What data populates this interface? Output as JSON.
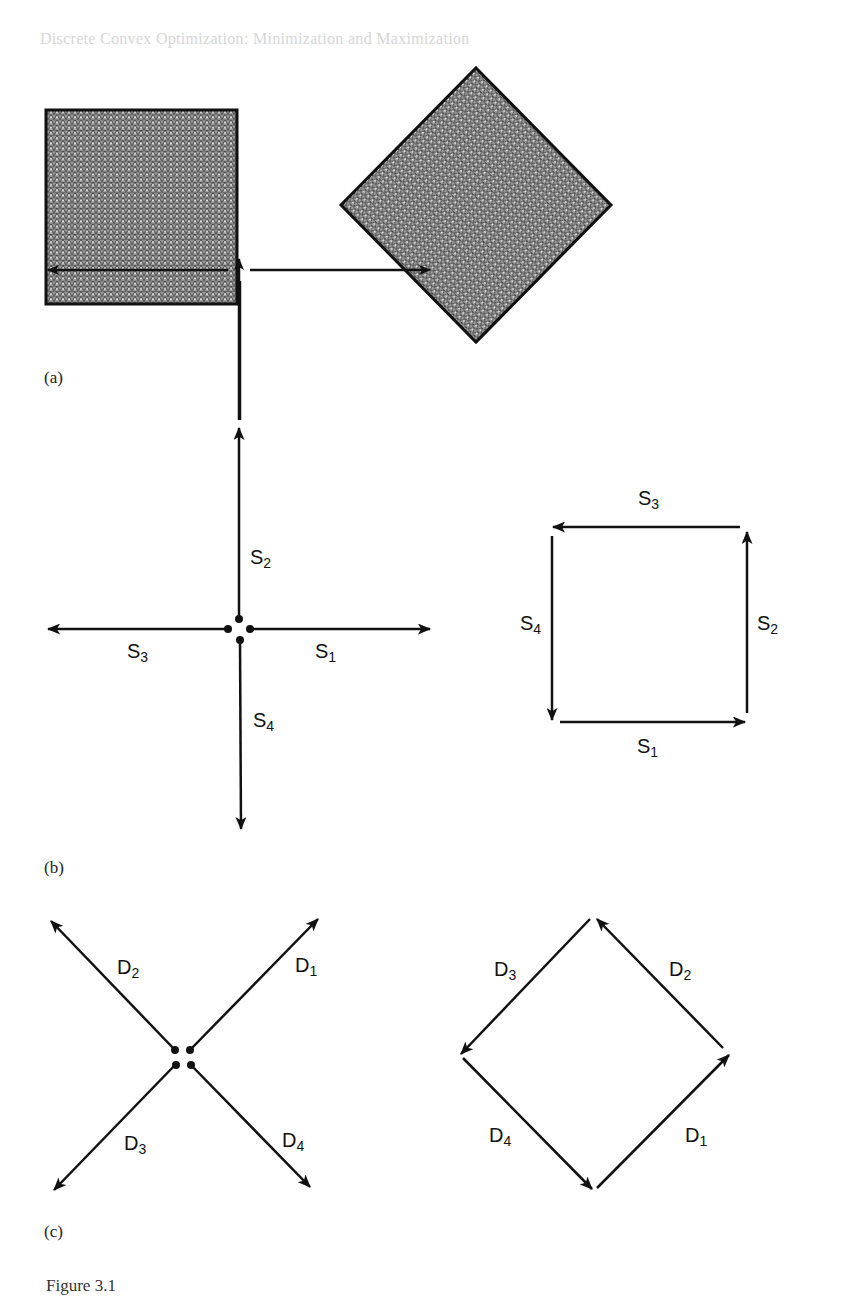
{
  "page": {
    "running_header": "Discrete Convex Optimization: Minimization and Maximization",
    "caption": "Figure 3.1"
  },
  "panels": {
    "a": {
      "label": "(a)",
      "shapes": [
        {
          "name": "axis-aligned square",
          "fill": "triangular mesh",
          "color": "#8a8a8a"
        },
        {
          "name": "rotated square (diamond)",
          "fill": "triangular mesh",
          "color": "#8a8a8a"
        }
      ]
    },
    "b": {
      "label": "(b)",
      "star": {
        "vectors": [
          {
            "name": "S",
            "sub": "1",
            "direction": "right"
          },
          {
            "name": "S",
            "sub": "2",
            "direction": "up"
          },
          {
            "name": "S",
            "sub": "3",
            "direction": "left"
          },
          {
            "name": "S",
            "sub": "4",
            "direction": "down"
          }
        ]
      },
      "cycle": {
        "edges": [
          {
            "name": "S",
            "sub": "1",
            "position": "bottom",
            "direction": "right"
          },
          {
            "name": "S",
            "sub": "2",
            "position": "right",
            "direction": "up"
          },
          {
            "name": "S",
            "sub": "3",
            "position": "top",
            "direction": "left"
          },
          {
            "name": "S",
            "sub": "4",
            "position": "left",
            "direction": "down"
          }
        ]
      }
    },
    "c": {
      "label": "(c)",
      "star": {
        "vectors": [
          {
            "name": "D",
            "sub": "1",
            "direction": "up-right"
          },
          {
            "name": "D",
            "sub": "2",
            "direction": "up-left"
          },
          {
            "name": "D",
            "sub": "3",
            "direction": "down-left"
          },
          {
            "name": "D",
            "sub": "4",
            "direction": "down-right"
          }
        ]
      },
      "cycle": {
        "edges": [
          {
            "name": "D",
            "sub": "1",
            "position": "lower-right",
            "direction": "up-right"
          },
          {
            "name": "D",
            "sub": "2",
            "position": "upper-right",
            "direction": "up-left"
          },
          {
            "name": "D",
            "sub": "3",
            "position": "upper-left",
            "direction": "down-left"
          },
          {
            "name": "D",
            "sub": "4",
            "position": "lower-left",
            "direction": "down-right"
          }
        ]
      }
    }
  }
}
